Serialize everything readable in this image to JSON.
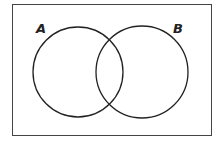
{
  "diagram": {
    "type": "venn",
    "sets": [
      {
        "label": "A"
      },
      {
        "label": "B"
      }
    ]
  }
}
